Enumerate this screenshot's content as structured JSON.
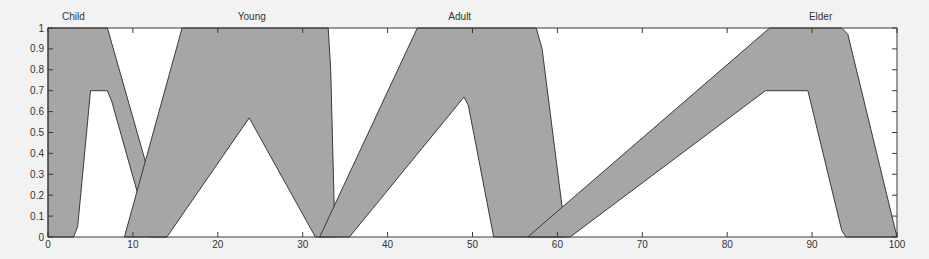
{
  "chart_data": {
    "type": "area",
    "title": "",
    "xlabel": "",
    "ylabel": "",
    "xlim": [
      0,
      100
    ],
    "ylim": [
      0,
      1
    ],
    "grid": false,
    "x_ticks": [
      0,
      10,
      20,
      30,
      40,
      50,
      60,
      70,
      80,
      90,
      100
    ],
    "y_ticks": [
      0,
      0.1,
      0.2,
      0.3,
      0.4,
      0.5,
      0.6,
      0.7,
      0.8,
      0.9,
      1
    ],
    "y_tick_labels": [
      "0",
      "0.1",
      "0.2",
      "0.3",
      "0.4",
      "0.5",
      "0.6",
      "0.7",
      "0.8",
      "0.9",
      "1"
    ],
    "colors": {
      "fill": "#a6a6a6",
      "line": "#3a3a3a",
      "background": "#ffffff",
      "page": "#f2f2f2"
    },
    "series": [
      {
        "name": "Child",
        "label_x": 3,
        "upper": [
          [
            0,
            0
          ],
          [
            0,
            1
          ],
          [
            7,
            1
          ],
          [
            14,
            0
          ]
        ],
        "lower": [
          [
            3,
            0
          ],
          [
            3.5,
            0.05
          ],
          [
            5,
            0.7
          ],
          [
            7,
            0.7
          ],
          [
            7.5,
            0.65
          ],
          [
            12,
            0
          ]
        ]
      },
      {
        "name": "Young",
        "label_x": 24,
        "upper": [
          [
            9,
            0
          ],
          [
            15.8,
            1
          ],
          [
            33,
            1
          ],
          [
            33.3,
            0.8
          ],
          [
            33.8,
            0
          ]
        ],
        "lower": [
          [
            14,
            0
          ],
          [
            23.7,
            0.57
          ],
          [
            31.5,
            0
          ]
        ]
      },
      {
        "name": "Adult",
        "label_x": 48.5,
        "upper": [
          [
            32,
            0
          ],
          [
            43.5,
            1
          ],
          [
            57.5,
            1
          ],
          [
            58.2,
            0.9
          ],
          [
            61,
            0
          ]
        ],
        "lower": [
          [
            35.5,
            0
          ],
          [
            49,
            0.67
          ],
          [
            49.5,
            0.63
          ],
          [
            52.5,
            0
          ]
        ]
      },
      {
        "name": "Elder",
        "label_x": 91,
        "upper": [
          [
            56.5,
            0
          ],
          [
            85,
            1
          ],
          [
            93.5,
            1
          ],
          [
            94.2,
            0.97
          ],
          [
            100,
            0
          ]
        ],
        "lower": [
          [
            61.5,
            0
          ],
          [
            84.5,
            0.7
          ],
          [
            89.5,
            0.7
          ],
          [
            93.5,
            0.03
          ],
          [
            94,
            0
          ]
        ]
      }
    ]
  }
}
